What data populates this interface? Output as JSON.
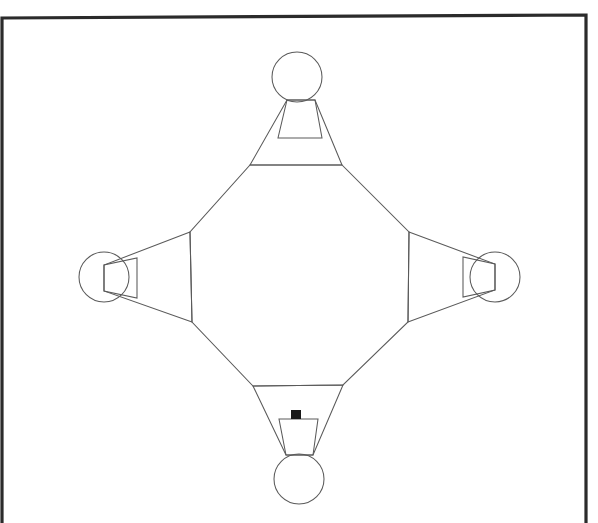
{
  "document": {
    "title": "Octagonal Hub Diagram",
    "background_color": "#ffffff",
    "width": 598,
    "height": 523
  },
  "colors": {
    "frame_stroke": "#2b2b2b",
    "shape_stroke": "#5a5a5a",
    "marker_fill": "#181818",
    "background": "#ffffff"
  },
  "frame": {
    "label": "page-border",
    "stroke_width": 3.2,
    "points": "2,523 2,18 586,15 586,523"
  },
  "diagram": {
    "type": "octagon-hub-with-four-nodes",
    "center": {
      "x": 300,
      "y": 276
    },
    "octagon": {
      "label": "central-octagon",
      "points": "250,165 342,165 409,232 408,322 343,385 253,386 192,322 190,232"
    },
    "nodes": [
      {
        "id": "north",
        "label": "top-node",
        "circle": {
          "cx": 297,
          "cy": 77,
          "r": 25
        },
        "petal_points": "250,165 287,100 315,100 342,165",
        "tongue_points": "287,100 315,100 322,138 278,138"
      },
      {
        "id": "west",
        "label": "left-node",
        "circle": {
          "cx": 104,
          "cy": 277,
          "r": 25
        },
        "petal_points": "190,232 104,265 104,291 192,322",
        "tongue_points": "104,265 104,291 137,298 137,258"
      },
      {
        "id": "east",
        "label": "right-node",
        "circle": {
          "cx": 495,
          "cy": 277,
          "r": 25
        },
        "petal_points": "409,232 495,264 495,290 408,322",
        "tongue_points": "495,264 495,290 463,297 463,257"
      },
      {
        "id": "south",
        "label": "bottom-node",
        "circle": {
          "cx": 299,
          "cy": 479,
          "r": 25
        },
        "petal_points": "253,386 286,455 313,455 343,385",
        "tongue_points": "286,455 313,455 318,419 279,419"
      }
    ],
    "marker": {
      "label": "black-square-marker",
      "x": 291,
      "y": 410,
      "width": 10,
      "height": 9
    }
  }
}
